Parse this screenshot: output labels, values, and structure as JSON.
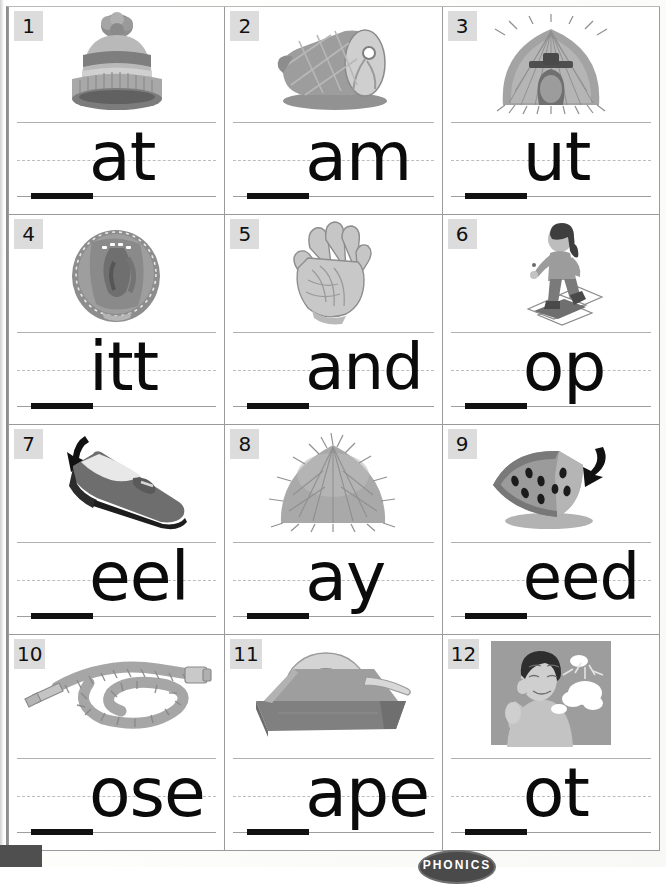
{
  "worksheet": {
    "title": "Beginning Sounds Phonics Worksheet",
    "badge_label": "PHONICS",
    "grid": {
      "columns": 3,
      "rows": 4
    },
    "blank_mark": "____"
  },
  "cells": [
    {
      "number": "1",
      "picture": "knit-hat",
      "ending": "at",
      "answer_word": "hat"
    },
    {
      "number": "2",
      "picture": "ham",
      "ending": "am",
      "answer_word": "ham"
    },
    {
      "number": "3",
      "picture": "hut",
      "ending": "ut",
      "answer_word": "hut"
    },
    {
      "number": "4",
      "picture": "baseball-mitt",
      "ending": "itt",
      "answer_word": "mitt"
    },
    {
      "number": "5",
      "picture": "hand",
      "ending": "and",
      "answer_word": "hand"
    },
    {
      "number": "6",
      "picture": "child-hopping",
      "ending": "op",
      "answer_word": "hop"
    },
    {
      "number": "7",
      "picture": "shoe-heel",
      "ending": "eel",
      "answer_word": "heel"
    },
    {
      "number": "8",
      "picture": "haystack",
      "ending": "ay",
      "answer_word": "hay"
    },
    {
      "number": "9",
      "picture": "watermelon-seed",
      "ending": "eed",
      "answer_word": "seed"
    },
    {
      "number": "10",
      "picture": "garden-hose",
      "ending": "ose",
      "answer_word": "hose"
    },
    {
      "number": "11",
      "picture": "tape-dispenser",
      "ending": "ape",
      "answer_word": "tape"
    },
    {
      "number": "12",
      "picture": "hot-person",
      "ending": "ot",
      "answer_word": "hot"
    }
  ],
  "colors": {
    "grid_line": "#9a9a9a",
    "number_badge_bg": "#dcdcdc",
    "writing_line_top": "#b0b0b0",
    "writing_line_mid": "#bdbdbd",
    "writing_line_base": "#9d9d9d",
    "ink": "#0b0b0b",
    "badge_bg": "#4a4a4a"
  }
}
